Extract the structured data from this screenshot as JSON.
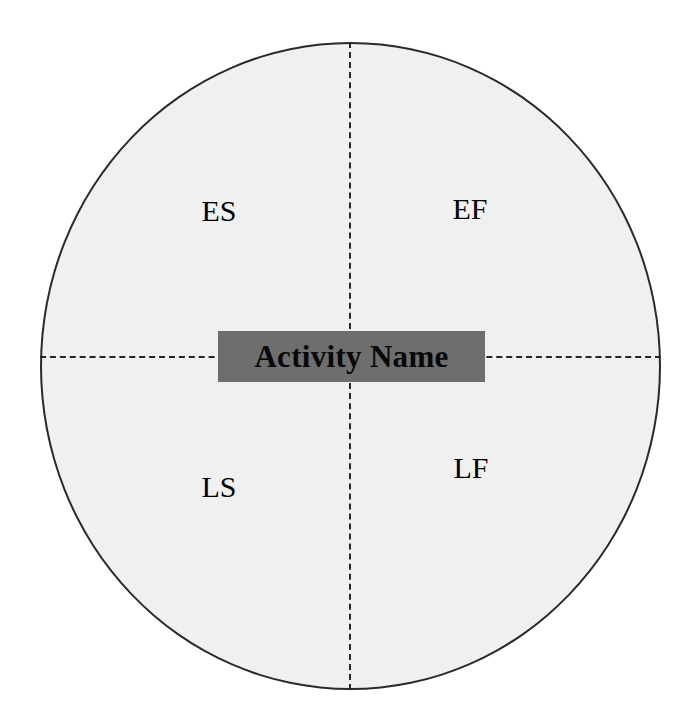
{
  "diagram": {
    "type": "activity-on-node-circle",
    "center_label": {
      "text": "Activity Name",
      "box_color": "#6e6e6e",
      "text_color": "#080808"
    },
    "circle": {
      "fill_color": "#f0f0f0",
      "border_color": "#2a2a2a"
    },
    "divider_color": "#262626",
    "quadrants": [
      {
        "key": "ES",
        "label": "ES",
        "position": "top-left"
      },
      {
        "key": "EF",
        "label": "EF",
        "position": "top-right"
      },
      {
        "key": "LS",
        "label": "LS",
        "position": "bottom-left"
      },
      {
        "key": "LF",
        "label": "LF",
        "position": "bottom-right"
      }
    ]
  }
}
